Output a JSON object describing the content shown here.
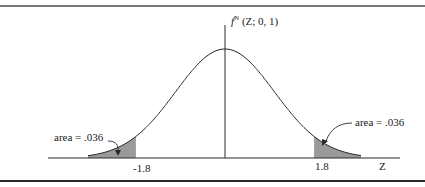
{
  "figure": {
    "function_label": {
      "f": "f",
      "superscript": "N",
      "args": " (Z; 0, 1)"
    },
    "axis_label": "Z",
    "ticks": [
      "-1.8",
      "1.8"
    ],
    "left_area_label": "area = .036",
    "right_area_label": "area = .036"
  },
  "chart_data": {
    "type": "area",
    "xlabel": "Z",
    "ylabel": "",
    "distribution": "standard normal",
    "mean": 0,
    "sd": 1,
    "shaded_regions": [
      {
        "from": "-inf",
        "to": -1.8,
        "area": 0.036,
        "label": "area = .036"
      },
      {
        "from": 1.8,
        "to": "inf",
        "area": 0.036,
        "label": "area = .036"
      }
    ],
    "tick_labels": [
      "-1.8",
      "1.8"
    ],
    "grid": false,
    "colors": {
      "curve": "#2a2a2a",
      "shade": "#9a9a9a",
      "rule": "#3a3a3a"
    }
  }
}
